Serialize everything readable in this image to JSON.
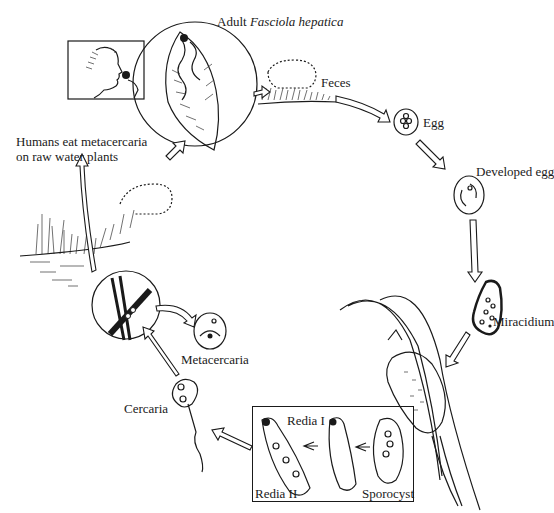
{
  "diagram": {
    "title_prefix": "Adult",
    "title_species": "Fasciola hepatica",
    "type": "life-cycle",
    "stages": [
      {
        "id": "adult",
        "label": "Adult Fasciola hepatica"
      },
      {
        "id": "feces",
        "label": "Feces"
      },
      {
        "id": "egg",
        "label": "Egg"
      },
      {
        "id": "developed_egg",
        "label": "Developed egg"
      },
      {
        "id": "miracidium",
        "label": "Miracidium"
      },
      {
        "id": "sporocyst",
        "label": "Sporocyst"
      },
      {
        "id": "redia_1",
        "label": "Redia I"
      },
      {
        "id": "redia_2",
        "label": "Redia II"
      },
      {
        "id": "cercaria",
        "label": "Cercaria"
      },
      {
        "id": "metacercaria",
        "label": "Metacercaria"
      },
      {
        "id": "humans",
        "label": "Humans eat metacercaria on raw water plants"
      }
    ],
    "labels": {
      "feces": "Feces",
      "egg": "Egg",
      "developed_egg": "Developed egg",
      "miracidium": "Miracidium",
      "redia_1": "Redia I",
      "redia_2": "Redia II",
      "sporocyst": "Sporocyst",
      "cercaria": "Cercaria",
      "metacercaria": "Metacercaria",
      "humans_line1": "Humans eat metacercaria",
      "humans_line2": "on raw water plants"
    },
    "flow": [
      "adult",
      "feces",
      "egg",
      "developed_egg",
      "miracidium",
      "snail",
      "sporocyst",
      "redia_1",
      "redia_2",
      "cercaria",
      "metacercaria",
      "water_plants",
      "humans",
      "adult"
    ],
    "icons": {
      "human": "human-profile-eating-icon",
      "sheep_top": "sheep-grazing-icon",
      "sheep_left": "sheep-grazing-icon",
      "snail": "snail-on-stem-icon",
      "water_plants": "water-plants-icon"
    }
  }
}
